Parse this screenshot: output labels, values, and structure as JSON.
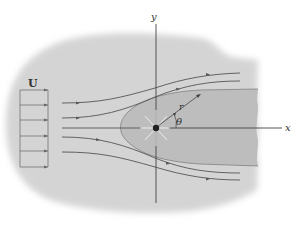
{
  "figure": {
    "labels": {
      "uniform_flow": "U",
      "y_axis": "y",
      "x_axis": "x",
      "radius": "r",
      "angle": "θ"
    },
    "colors": {
      "background": "#ffffff",
      "fluid_region": "#d4d4d4",
      "body_region": "#bdbdbd",
      "streamline": "#555555",
      "axis": "#444444",
      "source": "#222222",
      "source_rays": "#f2f2f2"
    },
    "elements": {
      "streamlines_count": 5,
      "uniform_flow_arrows": 6
    }
  }
}
